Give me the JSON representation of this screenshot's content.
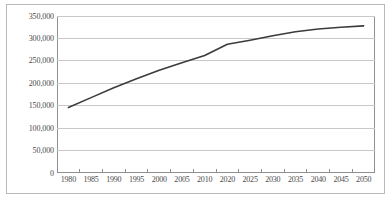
{
  "chart_data": {
    "type": "line",
    "title": "",
    "subtitle": "",
    "xlabel": "",
    "ylabel": "",
    "categories": [
      "1980",
      "1985",
      "1990",
      "1995",
      "2000",
      "2005",
      "2010",
      "2020",
      "2025",
      "2030",
      "2035",
      "2040",
      "2045",
      "2050"
    ],
    "values": [
      146000,
      168000,
      190000,
      210000,
      229000,
      246000,
      262000,
      287000,
      296000,
      306000,
      315000,
      321000,
      325000,
      328000
    ],
    "series": [
      {
        "name": "",
        "values": [
          146000,
          168000,
          190000,
          210000,
          229000,
          246000,
          262000,
          287000,
          296000,
          306000,
          315000,
          321000,
          325000,
          328000
        ]
      }
    ],
    "ylim": [
      0,
      350000
    ],
    "yticks": [
      0,
      50000,
      100000,
      150000,
      200000,
      250000,
      300000,
      350000
    ],
    "ytick_labels": [
      "0",
      "50,000",
      "100,000",
      "150,000",
      "200,000",
      "250,000",
      "300,000",
      "350,000"
    ],
    "xtick_labels": [
      "1980",
      "1985",
      "1990",
      "1995",
      "2000",
      "2005",
      "2010",
      "2020",
      "2025",
      "2030",
      "2035",
      "2040",
      "2045",
      "2050"
    ],
    "grid": true,
    "grid_axis": "y",
    "legend": false,
    "legend_position": "none",
    "line_color": "#3b3b3b",
    "grid_color": "#c8c8c8",
    "plot_border_color": "#8f8f8f",
    "outer_border_color": "#b9b9b9",
    "background_color": "#ffffff",
    "markers": false,
    "annotations": []
  }
}
